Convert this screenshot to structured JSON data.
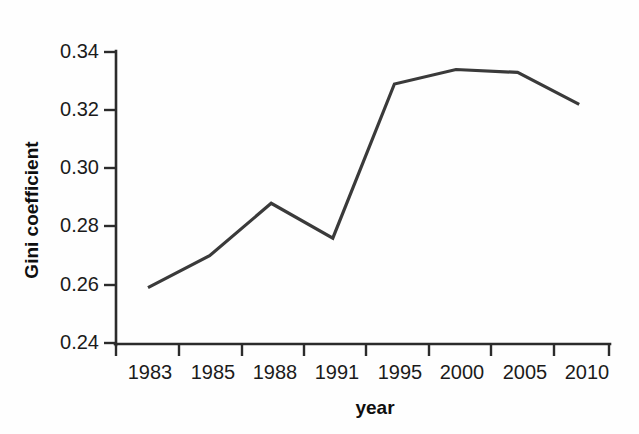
{
  "chart_data": {
    "type": "line",
    "title": "",
    "xlabel": "year",
    "ylabel": "Gini coefficient",
    "categories": [
      "1983",
      "1985",
      "1988",
      "1991",
      "1995",
      "2000",
      "2005",
      "2010"
    ],
    "values": [
      0.259,
      0.27,
      0.288,
      0.276,
      0.329,
      0.334,
      0.333,
      0.322
    ],
    "series": [
      {
        "name": "Gini coefficient",
        "values": [
          0.259,
          0.27,
          0.288,
          0.276,
          0.329,
          0.334,
          0.333,
          0.322
        ]
      }
    ],
    "ylim": [
      0.24,
      0.34
    ],
    "yticks": [
      "0.24",
      "0.26",
      "0.28",
      "0.30",
      "0.32",
      "0.34"
    ],
    "ytick_values": [
      0.24,
      0.26,
      0.28,
      0.3,
      0.32,
      0.34
    ],
    "xticks": [
      "1983",
      "1985",
      "1988",
      "1991",
      "1995",
      "2000",
      "2005",
      "2010"
    ],
    "grid": false,
    "legend": "none",
    "line_color": "#3a3a3a",
    "axis_color": "#2b2b2b",
    "background_color": "#fefefe"
  },
  "axes": {
    "y_title": "Gini coefficient",
    "x_title": "year",
    "y_labels": [
      "0.34",
      "0.32",
      "0.30",
      "0.28",
      "0.26",
      "0.24"
    ],
    "x_labels": [
      "1983",
      "1985",
      "1988",
      "1991",
      "1995",
      "2000",
      "2005",
      "2010"
    ]
  }
}
